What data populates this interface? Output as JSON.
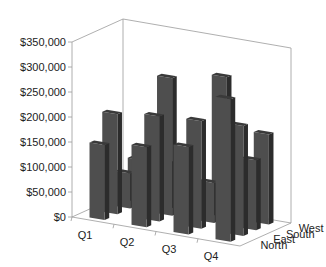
{
  "chart_data": {
    "type": "bar",
    "variant": "3d-column",
    "title": "",
    "xlabel": "",
    "ylabel": "",
    "categories": [
      "Q1",
      "Q2",
      "Q3",
      "Q4"
    ],
    "series": [
      {
        "name": "North",
        "values": [
          150000,
          160000,
          175000,
          285000
        ]
      },
      {
        "name": "East",
        "values": [
          200000,
          210000,
          215000,
          220000
        ]
      },
      {
        "name": "South",
        "values": [
          70000,
          275000,
          80000,
          140000
        ]
      },
      {
        "name": "West",
        "values": [
          85000,
          90000,
          280000,
          180000
        ]
      }
    ],
    "yticks": [
      "$0",
      "$50,000",
      "$100,000",
      "$150,000",
      "$200,000",
      "$250,000",
      "$300,000",
      "$350,000"
    ],
    "ylim": [
      0,
      350000
    ],
    "depth_labels": [
      "North",
      "East",
      "South",
      "West"
    ],
    "grid": false,
    "legend": "none",
    "bar_color": "#4a4a4a"
  }
}
